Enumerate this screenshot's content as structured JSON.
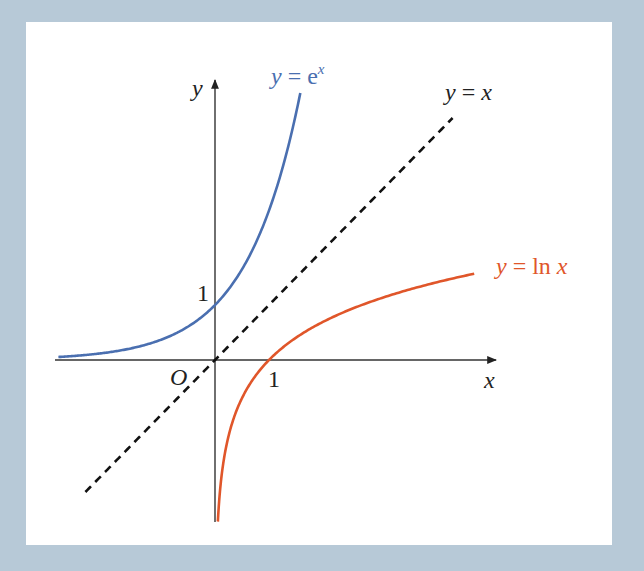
{
  "chart_data": {
    "type": "line",
    "title": "",
    "xlabel": "x",
    "ylabel": "y",
    "origin_label": "O",
    "ticks": {
      "x": [
        {
          "value": 1,
          "label": "1"
        }
      ],
      "y": [
        {
          "value": 1,
          "label": "1"
        }
      ]
    },
    "grid": false,
    "legend": "inline labels",
    "series": [
      {
        "name": "y = e^x",
        "function": "exp",
        "color": "#4a6fb0",
        "style": "solid",
        "x_range": [
          -2.9,
          1.58
        ]
      },
      {
        "name": "y = ln x",
        "function": "ln",
        "color": "#e0562a",
        "style": "solid",
        "x_range": [
          0.053,
          4.8
        ]
      },
      {
        "name": "y = x",
        "function": "identity",
        "color": "#111111",
        "style": "dashed",
        "x_range": [
          -2.4,
          4.4
        ]
      }
    ],
    "axis_ranges": {
      "x": [
        -2.95,
        5.3
      ],
      "y": [
        -3.0,
        5.2
      ]
    }
  },
  "layout": {
    "origin_px": [
      215,
      360
    ],
    "unit_px": [
      54,
      55
    ]
  },
  "labels": {
    "exp": {
      "y": "y",
      "eq": " = e",
      "sup": "x"
    },
    "ln": {
      "y": "y",
      "eq": " = ln ",
      "x": "x"
    },
    "identity": {
      "y": "y",
      "eq": " = ",
      "x": "x"
    },
    "x_axis": "x",
    "y_axis": "y",
    "origin": "O",
    "x_tick_1": "1",
    "y_tick_1": "1"
  }
}
